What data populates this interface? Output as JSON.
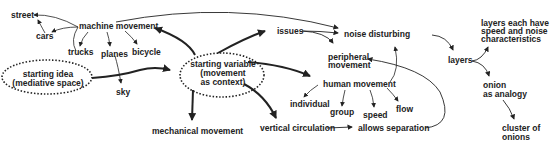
{
  "diagram": {
    "nodes": {
      "street": "street",
      "cars": "cars",
      "machine_movement": "machine movement",
      "trucks": "trucks",
      "planes": "planes",
      "bicycle": "bicycle",
      "sky": "sky",
      "starting_idea_l1": "starting idea",
      "starting_idea_l2": "(mediative space)",
      "starting_variable_l1": "starting variable",
      "starting_variable_l2": "(movement",
      "starting_variable_l3": "as context)",
      "mechanical_movement": "mechanical movement",
      "issues": "issues",
      "peripheral_l1": "peripheral",
      "peripheral_l2": "movement",
      "noise_disturbing": "noise disturbing",
      "human_movement": "human movement",
      "individual": "individual",
      "group": "group",
      "speed": "speed",
      "flow": "flow",
      "vertical_circulation": "vertical circulation",
      "allows_separation": "allows separation",
      "layers": "layers",
      "layers_each_l1": "layers each have",
      "layers_each_l2": "speed and noise",
      "layers_each_l3": "characteristics",
      "onion_l1": "onion",
      "onion_l2": "as analogy",
      "cluster_l1": "cluster of",
      "cluster_l2": "onions"
    },
    "colors": {
      "ink": "#222222",
      "background": "#ffffff"
    }
  }
}
